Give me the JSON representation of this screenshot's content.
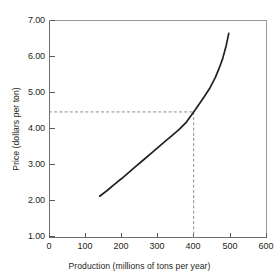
{
  "chart_data": {
    "type": "line",
    "title": "",
    "xlabel": "Production (millions of tons per year)",
    "ylabel": "Price (dollars per ton)",
    "xlim": [
      0,
      600
    ],
    "ylim": [
      1.0,
      7.0
    ],
    "xticks": [
      0,
      100,
      200,
      300,
      400,
      500,
      600
    ],
    "xtick_labels": [
      "0",
      "100",
      "200",
      "300",
      "400",
      "500",
      "600"
    ],
    "yticks": [
      1.0,
      2.0,
      3.0,
      4.0,
      5.0,
      6.0,
      7.0
    ],
    "ytick_labels": [
      "1.00",
      "2.00",
      "3.00",
      "4.00",
      "5.00",
      "6.00",
      "7.00"
    ],
    "grid": false,
    "legend": "none",
    "series": [
      {
        "name": "supply curve",
        "x": [
          140,
          160,
          180,
          200,
          220,
          240,
          260,
          280,
          300,
          320,
          340,
          360,
          380,
          400,
          415,
          430,
          445,
          460,
          470,
          480,
          490,
          497
        ],
        "y": [
          2.15,
          2.3,
          2.47,
          2.63,
          2.8,
          2.97,
          3.14,
          3.31,
          3.48,
          3.65,
          3.82,
          3.99,
          4.19,
          4.47,
          4.68,
          4.9,
          5.13,
          5.42,
          5.66,
          5.93,
          6.3,
          6.63
        ]
      }
    ],
    "annotations": [
      {
        "kind": "dashed-guide-horizontal",
        "y": 4.47,
        "x_from": 0,
        "x_to": 400,
        "label": ""
      },
      {
        "kind": "dashed-guide-vertical",
        "x": 400,
        "y_from": 1.0,
        "y_to": 4.47,
        "label": ""
      },
      {
        "kind": "equilibrium-point",
        "x": 400,
        "y": 4.47,
        "label": ""
      }
    ],
    "colors": {
      "curve": "#231f20",
      "guide": "#8c8c8c",
      "axis": "#6f6f6f",
      "background": "#ffffff"
    }
  }
}
